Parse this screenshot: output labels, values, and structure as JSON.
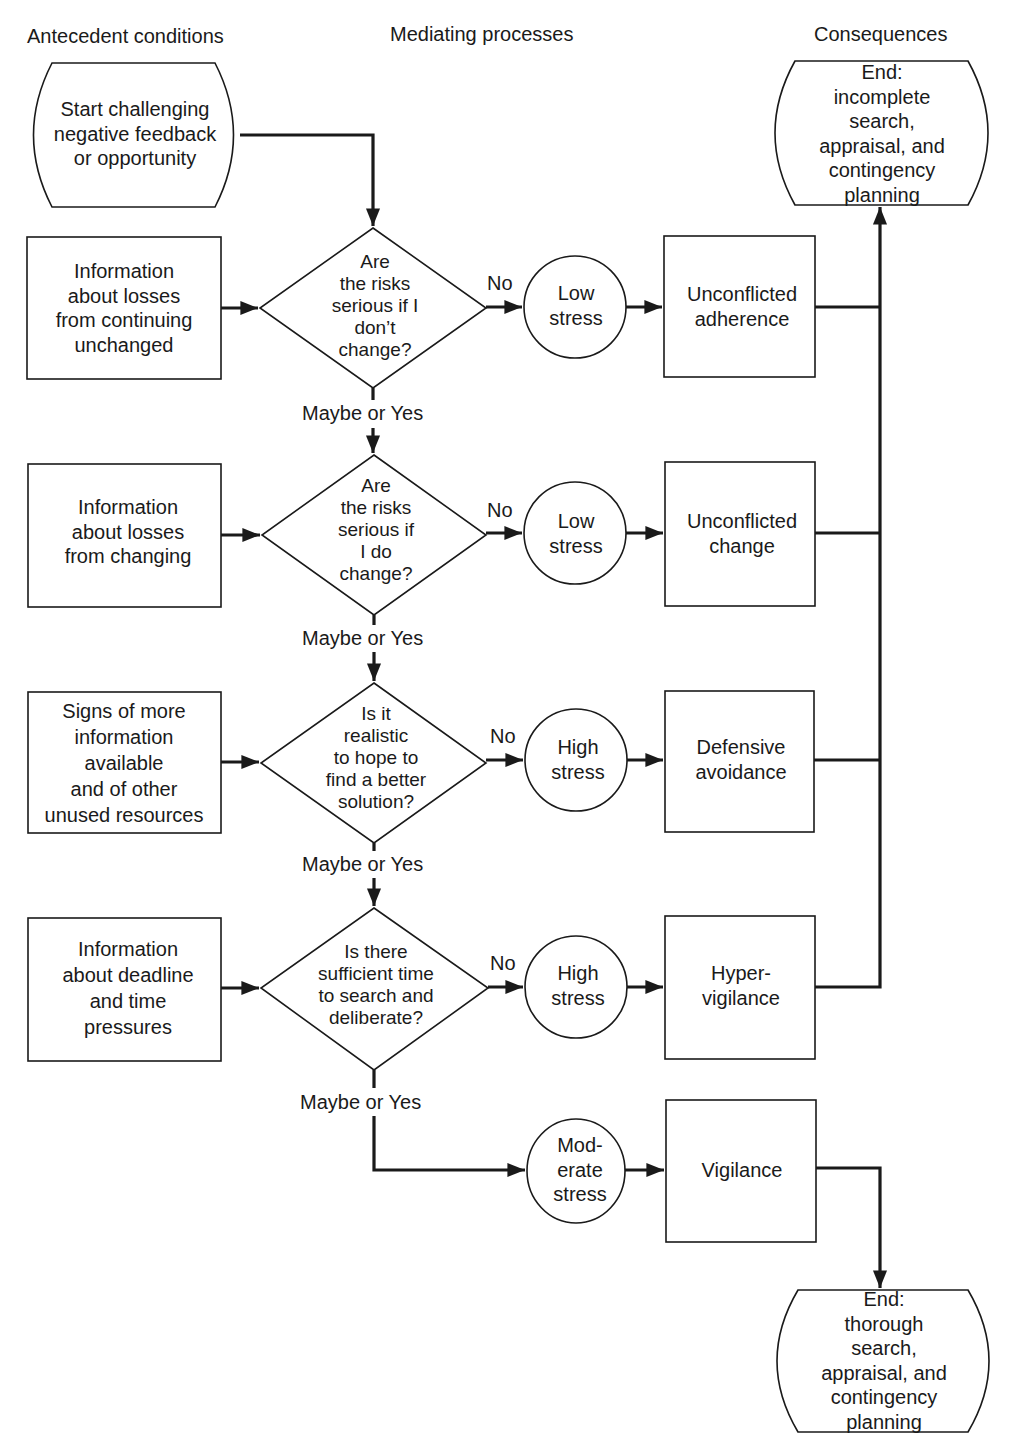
{
  "columns": {
    "antecedent": "Antecedent conditions",
    "mediating": "Mediating processes",
    "consequences": "Consequences"
  },
  "start": {
    "label": "Start challenging\nnegative feedback\nor opportunity"
  },
  "end_incomplete": {
    "label": "End:\nincomplete search,\nappraisal, and\ncontingency\nplanning"
  },
  "end_thorough": {
    "label": "End:\nthorough search,\nappraisal, and\ncontingency\nplanning"
  },
  "rows": [
    {
      "antecedent": "Information\nabout losses\nfrom continuing\nunchanged",
      "question": "Are\nthe risks\nserious if I\ndon’t\nchange?",
      "no_label": "No",
      "stress": "Low\nstress",
      "outcome": "Unconflicted\nadherence",
      "yes_label": "Maybe or Yes"
    },
    {
      "antecedent": "Information\nabout losses\nfrom changing",
      "question": "Are\nthe risks\nserious if\nI do\nchange?",
      "no_label": "No",
      "stress": "Low\nstress",
      "outcome": "Unconflicted\nchange",
      "yes_label": "Maybe or Yes"
    },
    {
      "antecedent": "Signs of more\ninformation\navailable\nand of other\nunused resources",
      "question": "Is it\nrealistic\nto hope to\nfind a better\nsolution?",
      "no_label": "No",
      "stress": "High\nstress",
      "outcome": "Defensive\navoidance",
      "yes_label": "Maybe or Yes"
    },
    {
      "antecedent": "Information\nabout deadline\nand time\npressures",
      "question": "Is there\nsufficient time\nto search and\ndeliberate?",
      "no_label": "No",
      "stress": "High\nstress",
      "outcome": "Hyper-\nvigilance",
      "yes_label": "Maybe or Yes"
    }
  ],
  "final": {
    "stress": "Mod-\nerate\nstress",
    "outcome": "Vigilance"
  },
  "colors": {
    "ink": "#1a1a1a",
    "background": "#ffffff"
  }
}
